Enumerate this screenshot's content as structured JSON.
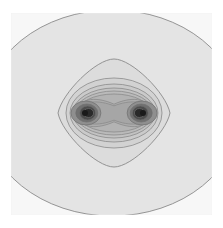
{
  "chart_data": {
    "type": "heatmap",
    "subtype": "contour",
    "title": "",
    "xlabel": "",
    "ylabel": "",
    "grid": false,
    "legend": null,
    "frame": {
      "x": 11,
      "y": 13,
      "width": 201,
      "height": 202
    },
    "colors": {
      "background": "#ffffff",
      "outer_fill": "#e4e4e4",
      "contour_line": "#8a8a8a",
      "core_dark": "#1a1a1a"
    },
    "centers": [
      {
        "label": "left-center",
        "x": 85,
        "y": 113
      },
      {
        "label": "right-center",
        "x": 143,
        "y": 113
      }
    ],
    "contour_levels": [
      {
        "level": 1,
        "shape": "outer",
        "cx": 112,
        "cy": 113,
        "rx": 150,
        "ry": 102
      },
      {
        "level": 2,
        "shape": "diamond-rounded",
        "cx": 114,
        "cy": 113,
        "rx": 56,
        "ry": 54
      },
      {
        "level": 3,
        "shape": "ellipse",
        "cx": 114,
        "cy": 113,
        "rx": 48,
        "ry": 35
      },
      {
        "level": 4,
        "shape": "ellipse",
        "cx": 114,
        "cy": 113,
        "rx": 44,
        "ry": 29
      },
      {
        "level": 5,
        "shape": "ellipse",
        "cx": 114,
        "cy": 113,
        "rx": 41,
        "ry": 25
      },
      {
        "level": 6,
        "shape": "ellipse",
        "cx": 114,
        "cy": 113,
        "rx": 39,
        "ry": 22
      },
      {
        "level": 7,
        "shape": "ellipse",
        "cx": 114,
        "cy": 113,
        "rx": 37,
        "ry": 19
      },
      {
        "level": 8,
        "shape": "dumbbell",
        "cx": 114,
        "cy": 113,
        "rx": 35,
        "ry": 16
      },
      {
        "level": 9,
        "shape": "dumbbell",
        "cx": 114,
        "cy": 113,
        "rx": 33,
        "ry": 13
      },
      {
        "level": 10,
        "shape": "split",
        "rx": 15,
        "ry": 12
      },
      {
        "level": 11,
        "shape": "split",
        "rx": 11,
        "ry": 9
      },
      {
        "level": 12,
        "shape": "split",
        "rx": 8,
        "ry": 7
      },
      {
        "level": 13,
        "shape": "split",
        "rx": 5,
        "ry": 4.5
      }
    ]
  }
}
